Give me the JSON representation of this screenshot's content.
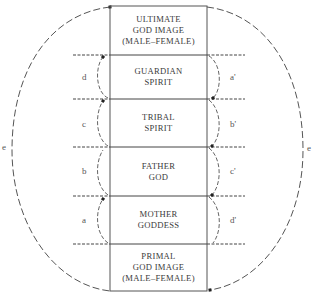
{
  "diagram": {
    "stages": [
      {
        "id": "ultimate",
        "lines": [
          "ULTIMATE",
          "GOD IMAGE",
          "(MALE–FEMALE)"
        ]
      },
      {
        "id": "guardian",
        "lines": [
          "GUARDIAN",
          "SPIRIT"
        ]
      },
      {
        "id": "tribal",
        "lines": [
          "TRIBAL",
          "SPIRIT"
        ]
      },
      {
        "id": "father",
        "lines": [
          "FATHER",
          "GOD"
        ]
      },
      {
        "id": "mother",
        "lines": [
          "MOTHER",
          "GODDESS"
        ]
      },
      {
        "id": "primal",
        "lines": [
          "PRIMAL",
          "GOD IMAGE",
          "(MALE–FEMALE)"
        ]
      }
    ],
    "left_labels": [
      "d",
      "c",
      "b",
      "a"
    ],
    "right_labels": [
      "a'",
      "b'",
      "c'",
      "d'"
    ],
    "outer_labels": {
      "left": "e",
      "right": "e"
    },
    "colors": {
      "ink": "#3a3a3a",
      "line": "#555555",
      "background": "#ffffff"
    }
  }
}
